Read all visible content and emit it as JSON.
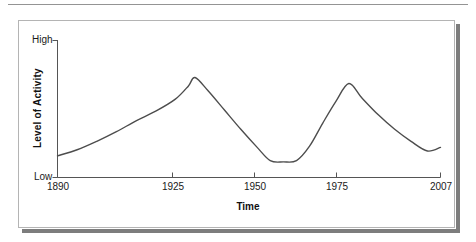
{
  "figure": {
    "panel_background": "#ffffff",
    "panel_border_color": "#b4b4b4",
    "shadow_color": "#7d7d7d",
    "top_rule_color": "#949494"
  },
  "chart_data": {
    "type": "line",
    "title": "",
    "subtitle": "",
    "xlabel": "Time",
    "ylabel": "Level of Activity",
    "grid": false,
    "legend": false,
    "legend_position": "none",
    "line_color": "#4d4d4d",
    "line_width": 1.4,
    "xlim": [
      1890,
      2007
    ],
    "ylim": [
      0,
      100
    ],
    "x_tick_labels": [
      "1890",
      "1925",
      "1950",
      "1975",
      "2007"
    ],
    "x_ticks": [
      1890,
      1925,
      1950,
      1975,
      2007
    ],
    "y_tick_labels": [
      "Low",
      "High"
    ],
    "y_axis_low_label": "Low",
    "y_axis_high_label": "High",
    "series": [
      {
        "name": "Level of Activity",
        "x": [
          1890,
          1896,
          1902,
          1908,
          1914,
          1920,
          1926,
          1930,
          1932,
          1936,
          1941,
          1946,
          1951,
          1955,
          1959,
          1963,
          1967,
          1971,
          1975,
          1979,
          1983,
          1988,
          1993,
          1998,
          2003,
          2007
        ],
        "values": [
          18,
          23,
          30,
          38,
          47,
          55,
          65,
          76,
          83,
          72,
          56,
          40,
          25,
          14,
          13,
          14,
          26,
          45,
          63,
          78,
          66,
          52,
          40,
          30,
          22,
          25
        ]
      }
    ],
    "annotations": []
  }
}
